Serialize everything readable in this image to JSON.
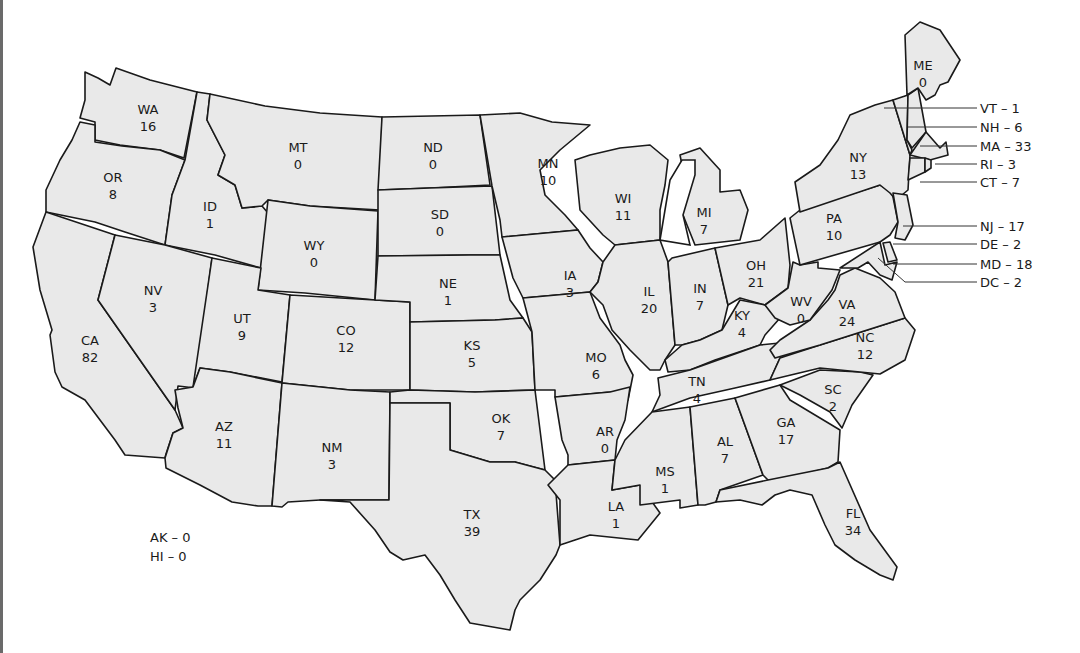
{
  "map": {
    "title": "",
    "fill_color": "#e9e9e9",
    "stroke_color": "#1a1a1a",
    "states": [
      {
        "abbr": "WA",
        "value": "16"
      },
      {
        "abbr": "OR",
        "value": "8"
      },
      {
        "abbr": "CA",
        "value": "82"
      },
      {
        "abbr": "ID",
        "value": "1"
      },
      {
        "abbr": "NV",
        "value": "3"
      },
      {
        "abbr": "MT",
        "value": "0"
      },
      {
        "abbr": "WY",
        "value": "0"
      },
      {
        "abbr": "UT",
        "value": "9"
      },
      {
        "abbr": "AZ",
        "value": "11"
      },
      {
        "abbr": "CO",
        "value": "12"
      },
      {
        "abbr": "NM",
        "value": "3"
      },
      {
        "abbr": "ND",
        "value": "0"
      },
      {
        "abbr": "SD",
        "value": "0"
      },
      {
        "abbr": "NE",
        "value": "1"
      },
      {
        "abbr": "KS",
        "value": "5"
      },
      {
        "abbr": "OK",
        "value": "7"
      },
      {
        "abbr": "TX",
        "value": "39"
      },
      {
        "abbr": "MN",
        "value": "10"
      },
      {
        "abbr": "IA",
        "value": "3"
      },
      {
        "abbr": "MO",
        "value": "6"
      },
      {
        "abbr": "AR",
        "value": "0"
      },
      {
        "abbr": "LA",
        "value": "1"
      },
      {
        "abbr": "WI",
        "value": "11"
      },
      {
        "abbr": "IL",
        "value": "20"
      },
      {
        "abbr": "MI",
        "value": "7"
      },
      {
        "abbr": "IN",
        "value": "7"
      },
      {
        "abbr": "OH",
        "value": "21"
      },
      {
        "abbr": "KY",
        "value": "4"
      },
      {
        "abbr": "TN",
        "value": "4"
      },
      {
        "abbr": "MS",
        "value": "1"
      },
      {
        "abbr": "AL",
        "value": "7"
      },
      {
        "abbr": "GA",
        "value": "17"
      },
      {
        "abbr": "FL",
        "value": "34"
      },
      {
        "abbr": "SC",
        "value": "2"
      },
      {
        "abbr": "NC",
        "value": "12"
      },
      {
        "abbr": "VA",
        "value": "24"
      },
      {
        "abbr": "WV",
        "value": "0"
      },
      {
        "abbr": "PA",
        "value": "10"
      },
      {
        "abbr": "NY",
        "value": "13"
      },
      {
        "abbr": "ME",
        "value": "0"
      }
    ],
    "callouts": [
      {
        "label": "VT – 1"
      },
      {
        "label": "NH – 6"
      },
      {
        "label": "MA – 33"
      },
      {
        "label": "RI – 3"
      },
      {
        "label": "CT – 7"
      },
      {
        "label": "NJ – 17"
      },
      {
        "label": "DE – 2"
      },
      {
        "label": "MD – 18"
      },
      {
        "label": "DC – 2"
      }
    ],
    "other": [
      {
        "label": "AK – 0"
      },
      {
        "label": "HI – 0"
      }
    ]
  }
}
